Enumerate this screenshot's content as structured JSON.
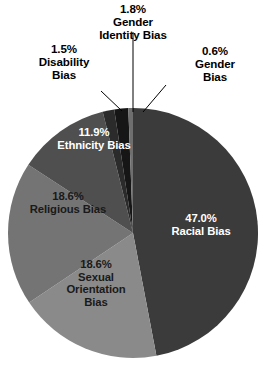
{
  "chart_data": {
    "type": "pie",
    "title": "",
    "subtitle": "",
    "xlabel": "",
    "ylabel": "",
    "legend_position": "none",
    "grid": false,
    "value_suffix": "%",
    "start_angle_deg": 0,
    "direction": "clockwise",
    "total": 100.0,
    "categories": [
      "Racial Bias",
      "Sexual Orientation Bias",
      "Religious Bias",
      "Ethnicity Bias",
      "Disability Bias",
      "Gender Identity Bias",
      "Gender Bias"
    ],
    "values": [
      47.0,
      18.6,
      18.6,
      11.9,
      1.5,
      1.8,
      0.6
    ],
    "slices": [
      {
        "name": "racial",
        "label": "Racial Bias",
        "percent_text": "47.0%",
        "value": 47.0,
        "color": "#3b3b3b",
        "label_placement": "inside",
        "text_color": "#ffffff",
        "label_text": "47.0%\nRacial Bias"
      },
      {
        "name": "sexual-orientation",
        "label": "Sexual Orientation Bias",
        "percent_text": "18.6%",
        "value": 18.6,
        "color": "#8a8a8a",
        "label_placement": "inside",
        "text_color": "#1a1a1a",
        "label_text": "18.6%\nSexual\nOrientation\nBias"
      },
      {
        "name": "religious",
        "label": "Religious Bias",
        "percent_text": "18.6%",
        "value": 18.6,
        "color": "#747474",
        "label_placement": "inside",
        "text_color": "#1a1a1a",
        "label_text": "18.6%\nReligious Bias"
      },
      {
        "name": "ethnicity",
        "label": "Ethnicity Bias",
        "percent_text": "11.9%",
        "value": 11.9,
        "color": "#4f4f4f",
        "label_placement": "inside",
        "text_color": "#ffffff",
        "label_text": "11.9%\nEthnicity Bias"
      },
      {
        "name": "disability",
        "label": "Disability Bias",
        "percent_text": "1.5%",
        "value": 1.5,
        "color": "#2b2b2b",
        "label_placement": "outside",
        "text_color": "#000000",
        "label_text": "1.5%\nDisability\nBias"
      },
      {
        "name": "gender-identity",
        "label": "Gender Identity Bias",
        "percent_text": "1.8%",
        "value": 1.8,
        "color": "#161616",
        "label_placement": "outside",
        "text_color": "#000000",
        "label_text": "1.8%\nGender\nIdentity Bias"
      },
      {
        "name": "gender",
        "label": "Gender Bias",
        "percent_text": "0.6%",
        "value": 0.6,
        "color": "#6f6f6f",
        "label_placement": "outside",
        "text_color": "#000000",
        "label_text": "0.6%\nGender\nBias"
      }
    ]
  },
  "labels": {
    "gender_identity": "1.8%\nGender\nIdentity Bias",
    "disability": "1.5%\nDisability\nBias",
    "gender": "0.6%\nGender\nBias",
    "ethnicity": "11.9%\nEthnicity Bias",
    "religious": "18.6%\nReligious Bias",
    "sexual_orientation": "18.6%\nSexual\nOrientation\nBias",
    "racial": "47.0%\nRacial Bias"
  },
  "geometry": {
    "center_x": 133,
    "center_y": 233,
    "radius": 125,
    "background": "#ffffff"
  }
}
